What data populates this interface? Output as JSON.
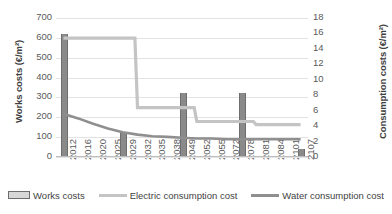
{
  "chart_data": {
    "type": "bar",
    "title": "",
    "xlabel": "",
    "ylabel": "Works costs (€/m²)",
    "y2label": "Consumption costs (€/m²)",
    "ylim": [
      0,
      700
    ],
    "y2lim": [
      0,
      18
    ],
    "yticks": [
      "0",
      "100",
      "200",
      "300",
      "400",
      "500",
      "600",
      "700"
    ],
    "y2ticks": [
      "0",
      "2",
      "4",
      "6",
      "8",
      "10",
      "12",
      "14",
      "16",
      "18"
    ],
    "grid": true,
    "legend_position": "bottom",
    "categories": [
      "2012",
      "2016",
      "2020",
      "2025",
      "2029",
      "2032",
      "2035",
      "2038",
      "2049",
      "2052",
      "2055",
      "2072",
      "2078",
      "2081",
      "2084",
      "2101",
      "2107"
    ],
    "series": [
      {
        "name": "Works costs",
        "type": "bar",
        "axis": "left",
        "color": "#8a8a8a",
        "values": [
          620,
          0,
          0,
          0,
          120,
          0,
          0,
          0,
          320,
          0,
          0,
          0,
          320,
          0,
          0,
          0,
          40
        ]
      },
      {
        "name": "Electric consumption cost",
        "type": "line",
        "axis": "right",
        "color": "#c4c4c4",
        "values": [
          15.4,
          15.4,
          15.4,
          15.4,
          15.4,
          6.4,
          6.4,
          6.4,
          6.4,
          4.6,
          4.6,
          4.6,
          4.6,
          4.2,
          4.2,
          4.2,
          4.2
        ]
      },
      {
        "name": "Water consumption cost",
        "type": "line",
        "axis": "right",
        "color": "#8f8f8f",
        "values": [
          5.6,
          5.0,
          4.3,
          3.7,
          3.2,
          2.9,
          2.7,
          2.6,
          2.5,
          2.4,
          2.4,
          2.3,
          2.3,
          2.3,
          2.3,
          2.3,
          2.3
        ]
      }
    ],
    "legend": [
      {
        "label": "Works costs",
        "marker": "bar-swatch",
        "color": "#d8d8d8"
      },
      {
        "label": "Electric consumption cost",
        "marker": "line-swatch",
        "color": "#c4c4c4"
      },
      {
        "label": "Water consumption cost",
        "marker": "line-swatch",
        "color": "#8f8f8f"
      }
    ]
  }
}
